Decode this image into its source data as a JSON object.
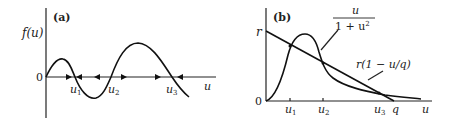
{
  "panel_a": {
    "label": "(a)",
    "y_axis_label": "f(u)",
    "x_axis_label": "u",
    "origin_label": "0",
    "roots": [
      "u1",
      "u2",
      "u3"
    ],
    "root_labels": [
      {
        "base": "u",
        "sub": "1"
      },
      {
        "base": "u",
        "sub": "2"
      },
      {
        "base": "u",
        "sub": "3"
      }
    ],
    "flow_arrows": [
      "right",
      "left",
      "left",
      "right",
      "right",
      "left"
    ]
  },
  "panel_b": {
    "label": "(b)",
    "y_tick_label": "r",
    "origin_label": "0",
    "x_axis_label": "u",
    "curve_label_numerator": "u",
    "curve_label_denominator": "1 + u",
    "curve_label_denominator_exp": "2",
    "line_label": "r(1 − u/q)",
    "x_tick_labels": [
      {
        "base": "u",
        "sub": "1"
      },
      {
        "base": "u",
        "sub": "2"
      },
      {
        "base": "u",
        "sub": "3"
      }
    ],
    "q_label": "q"
  }
}
